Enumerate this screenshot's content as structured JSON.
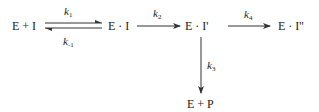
{
  "diagram": {
    "type": "reaction-scheme",
    "species": {
      "enzyme_inhibitor": "E + I",
      "complex1": "E · I",
      "complex2": "E · I'",
      "complex3": "E · I''",
      "product": "E + P"
    },
    "rate_constants": {
      "k1": {
        "base": "k",
        "sub": "1"
      },
      "k_minus1": {
        "base": "k",
        "sub": "-1"
      },
      "k2": {
        "base": "k",
        "sub": "2"
      },
      "k3": {
        "base": "k",
        "sub": "3"
      },
      "k4": {
        "base": "k",
        "sub": "4"
      }
    },
    "arrows": [
      {
        "from": "E + I",
        "to": "E · I",
        "label": "k1",
        "kind": "forward"
      },
      {
        "from": "E · I",
        "to": "E + I",
        "label": "k-1",
        "kind": "reverse"
      },
      {
        "from": "E · I",
        "to": "E · I'",
        "label": "k2",
        "kind": "forward"
      },
      {
        "from": "E · I'",
        "to": "E · I''",
        "label": "k4",
        "kind": "forward"
      },
      {
        "from": "E · I'",
        "to": "E + P",
        "label": "k3",
        "kind": "forward"
      }
    ],
    "colors": {
      "line": "#333333",
      "text": "#222222",
      "background": "#ffffff"
    }
  }
}
